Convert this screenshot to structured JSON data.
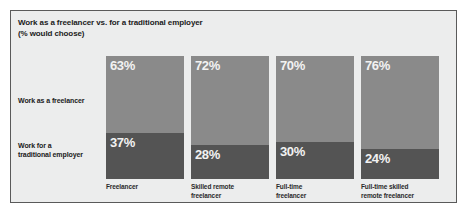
{
  "chart_data": {
    "type": "bar",
    "subtype": "stacked-100-percent",
    "title": "Work as a freelancer vs. for a traditional employer\n(% would choose)",
    "title_line1": "Work as a freelancer vs. for a traditional employer",
    "title_line2": "(% would choose)",
    "xlabel": "",
    "ylabel": "",
    "ylim": [
      0,
      100
    ],
    "grid": false,
    "legend_position": "left-axis-labels",
    "categories": [
      "Freelancer",
      "Skilled remote\nfreelancer",
      "Full-time\nfreelancer",
      "Full-time skilled\nremote freelancer"
    ],
    "series": [
      {
        "name": "Work as a freelancer",
        "color": "#8a8a8a",
        "values": [
          63,
          72,
          70,
          76
        ],
        "labels": [
          "63%",
          "72%",
          "70%",
          "76%"
        ]
      },
      {
        "name": "Work for a traditional employer",
        "color": "#545454",
        "values": [
          37,
          28,
          30,
          24
        ],
        "labels": [
          "37%",
          "28%",
          "30%",
          "24%"
        ]
      }
    ]
  },
  "row_labels": [
    "Work as a freelancer",
    "Work for a\ntraditional employer"
  ],
  "colors": {
    "background": "#eceded",
    "frame_border": "#5a5a5a",
    "segment_top": "#8a8a8a",
    "segment_bottom": "#545454",
    "value_text": "#f2f2f2",
    "title_text": "#1b1b1b"
  }
}
